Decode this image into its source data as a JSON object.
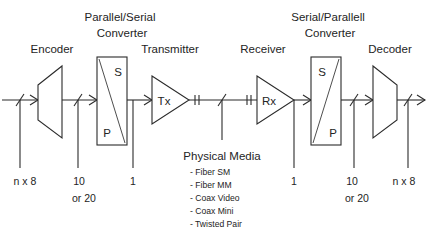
{
  "diagram": {
    "stroke_color": "#2b2b2b",
    "text_color": "#242424",
    "background": "#ffffff",
    "headings": {
      "parallel_serial_line1": "Parallel/Serial",
      "parallel_serial_line2": "Converter",
      "serial_parallel_line1": "Serial/Parallell",
      "serial_parallel_line2": "Converter"
    },
    "blocks": [
      {
        "id": "encoder",
        "label": "Encoder",
        "shape": "trapezoid-right"
      },
      {
        "id": "ps-converter",
        "label": "",
        "shape": "rect-diagonal",
        "top_letter": "S",
        "bottom_letter": "P"
      },
      {
        "id": "transmitter",
        "label": "Transmitter",
        "shape": "triangle-right",
        "inner": "Tx"
      },
      {
        "id": "receiver",
        "label": "Receiver",
        "shape": "triangle-right",
        "inner": "Rx"
      },
      {
        "id": "sp-converter",
        "label": "",
        "shape": "rect-diagonal",
        "top_letter": "S",
        "bottom_letter": "P"
      },
      {
        "id": "decoder",
        "label": "Decoder",
        "shape": "trapezoid-left"
      }
    ],
    "block_labels": {
      "encoder": "Encoder",
      "transmitter": "Transmitter",
      "receiver": "Receiver",
      "decoder": "Decoder"
    },
    "converter_letters": {
      "ps_top": "S",
      "ps_bottom": "P",
      "sp_top": "S",
      "sp_bottom": "P"
    },
    "amplifier_labels": {
      "tx": "Tx",
      "rx": "Rx"
    },
    "bus_widths": [
      {
        "id": "left-input",
        "value": "n x 8"
      },
      {
        "id": "encoder-output-a",
        "value": "10"
      },
      {
        "id": "encoder-output-b",
        "value": "or 20"
      },
      {
        "id": "serial-left",
        "value": "1"
      },
      {
        "id": "serial-right",
        "value": "1"
      },
      {
        "id": "decoder-input-a",
        "value": "10"
      },
      {
        "id": "decoder-input-b",
        "value": "or 20"
      },
      {
        "id": "right-output",
        "value": "n x 8"
      }
    ],
    "physical_media": {
      "heading": "Physical Media",
      "items": [
        "- Fiber SM",
        "- Fiber MM",
        "- Coax Video",
        "- Coax Mini",
        "- Twisted Pair"
      ]
    }
  }
}
